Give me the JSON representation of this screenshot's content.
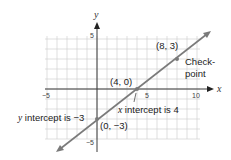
{
  "chart_data": {
    "type": "line",
    "title": "",
    "xlabel": "x",
    "ylabel": "y",
    "xlim": [
      -5,
      10
    ],
    "ylim": [
      -5,
      5
    ],
    "grid": true,
    "x_ticks": [
      -5,
      5,
      10
    ],
    "y_ticks": [
      5,
      -5
    ],
    "x_tick_labels": [
      "−5",
      "5",
      "10"
    ],
    "y_tick_labels": [
      "5",
      "−5"
    ],
    "series": [
      {
        "name": "line",
        "equation": "y = (3/4)x - 3",
        "x": [
          -4,
          11.3
        ],
        "y": [
          -6.1,
          5.6
        ],
        "color": "#7a7a7a"
      }
    ],
    "points": [
      {
        "x": 0,
        "y": -3,
        "label": "(0, −3)"
      },
      {
        "x": 4,
        "y": 0,
        "label": "(4, 0)"
      },
      {
        "x": 8,
        "y": 3,
        "label": "(8, 3)"
      }
    ],
    "annotations": [
      {
        "text": "y intercept is −3",
        "italic_prefix": "y",
        "rest": " intercept is −3"
      },
      {
        "text": "x intercept is 4",
        "italic_prefix": "x",
        "rest": " intercept is 4"
      },
      {
        "text": "Check-point",
        "line1": "Check-",
        "line2": "point"
      }
    ]
  }
}
